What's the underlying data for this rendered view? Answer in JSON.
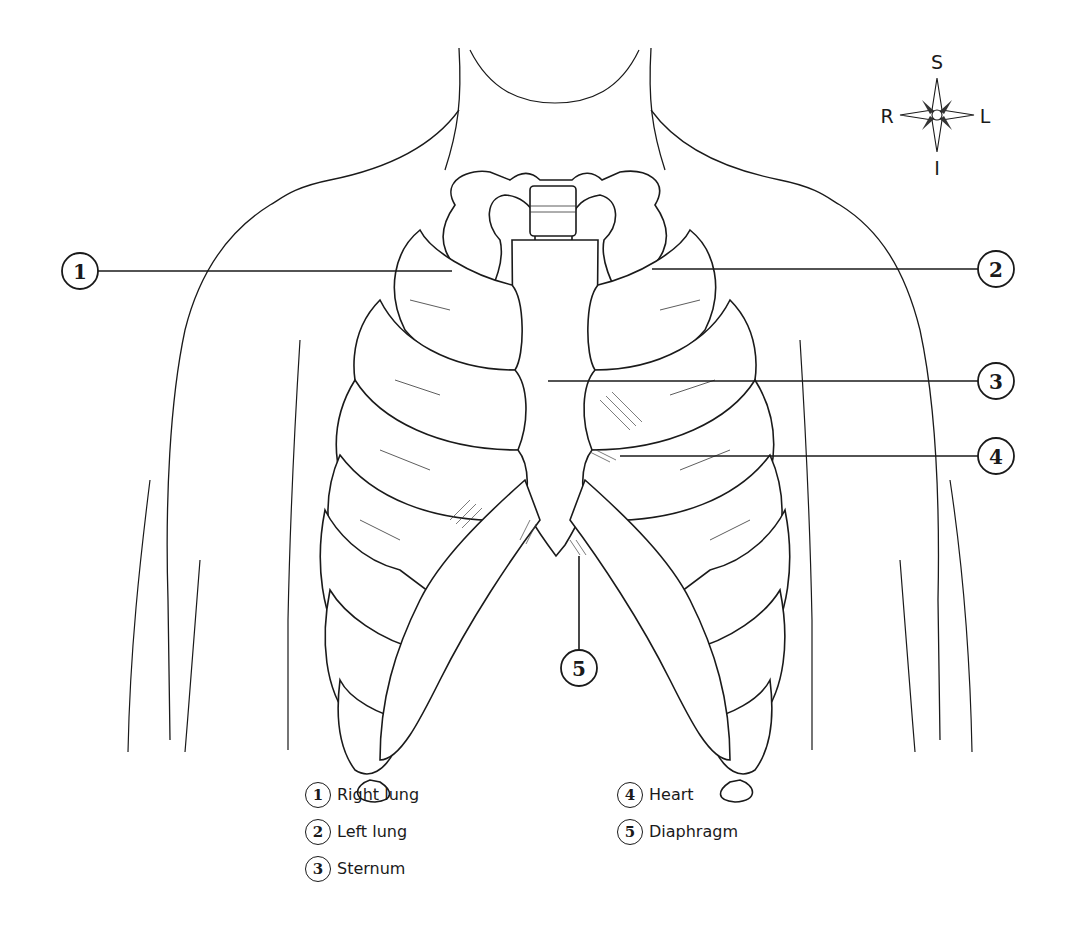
{
  "figure": {
    "type": "anatomical-diagram"
  },
  "compass": {
    "superior": "S",
    "inferior": "I",
    "right": "R",
    "left": "L"
  },
  "callouts": [
    {
      "number": "1",
      "label": "Right lung"
    },
    {
      "number": "2",
      "label": "Left lung"
    },
    {
      "number": "3",
      "label": "Sternum"
    },
    {
      "number": "4",
      "label": "Heart"
    },
    {
      "number": "5",
      "label": "Diaphragm"
    }
  ],
  "legend": {
    "column1": [
      {
        "number": "1",
        "label": "Right lung"
      },
      {
        "number": "2",
        "label": "Left lung"
      },
      {
        "number": "3",
        "label": "Sternum"
      }
    ],
    "column2": [
      {
        "number": "4",
        "label": "Heart"
      },
      {
        "number": "5",
        "label": "Diaphragm"
      }
    ]
  },
  "colors": {
    "line": "#1a1a1a",
    "background": "#ffffff"
  }
}
